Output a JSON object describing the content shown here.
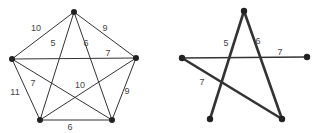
{
  "colors": {
    "edge": "#333333",
    "vertex": "#222222",
    "label": "#444444"
  },
  "graph_complete": {
    "vertices": [
      {
        "id": "A",
        "x": 74,
        "y": 12
      },
      {
        "id": "B",
        "x": 136,
        "y": 58
      },
      {
        "id": "C",
        "x": 112,
        "y": 120
      },
      {
        "id": "D",
        "x": 40,
        "y": 120
      },
      {
        "id": "E",
        "x": 12,
        "y": 59
      }
    ],
    "edges": [
      {
        "from": "A",
        "to": "E",
        "weight": "10",
        "lx": 36,
        "ly": 31
      },
      {
        "from": "A",
        "to": "B",
        "weight": "9",
        "lx": 105,
        "ly": 31
      },
      {
        "from": "A",
        "to": "D",
        "weight": "5",
        "lx": 53,
        "ly": 46
      },
      {
        "from": "A",
        "to": "C",
        "weight": "6",
        "lx": 86,
        "ly": 46
      },
      {
        "from": "E",
        "to": "B",
        "weight": "7",
        "lx": 108,
        "ly": 56
      },
      {
        "from": "E",
        "to": "C",
        "weight": "7",
        "lx": 33,
        "ly": 86
      },
      {
        "from": "D",
        "to": "B",
        "weight": "10",
        "lx": 80,
        "ly": 88
      },
      {
        "from": "E",
        "to": "D",
        "weight": "11",
        "lx": 15,
        "ly": 95
      },
      {
        "from": "B",
        "to": "C",
        "weight": "9",
        "lx": 127,
        "ly": 94
      },
      {
        "from": "D",
        "to": "C",
        "weight": "6",
        "lx": 70,
        "ly": 130
      }
    ]
  },
  "graph_tree": {
    "vertices": [
      {
        "id": "A",
        "x": 244,
        "y": 11
      },
      {
        "id": "B",
        "x": 307,
        "y": 57
      },
      {
        "id": "C",
        "x": 282,
        "y": 119
      },
      {
        "id": "D",
        "x": 210,
        "y": 119
      },
      {
        "id": "E",
        "x": 182,
        "y": 58
      }
    ],
    "edges": [
      {
        "from": "A",
        "to": "D",
        "weight": "5",
        "lx": 226,
        "ly": 46
      },
      {
        "from": "A",
        "to": "C",
        "weight": "6",
        "lx": 258,
        "ly": 44
      },
      {
        "from": "E",
        "to": "B",
        "weight": "7",
        "lx": 280,
        "ly": 55
      },
      {
        "from": "E",
        "to": "C",
        "weight": "7",
        "lx": 202,
        "ly": 85
      }
    ]
  }
}
